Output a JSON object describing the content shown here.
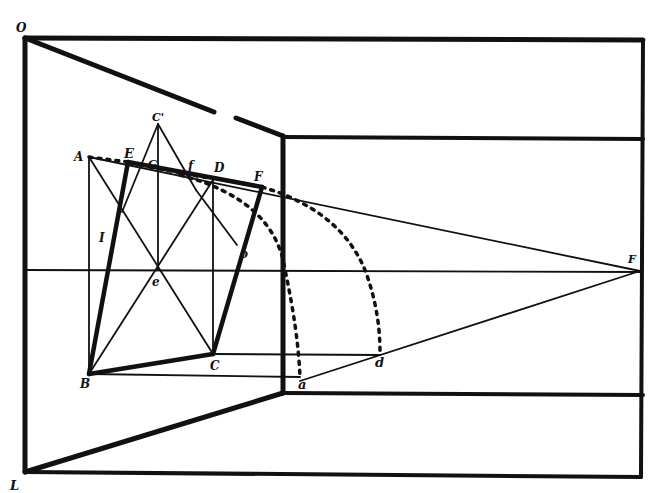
{
  "diagram": {
    "type": "perspective geometric construction",
    "ink_color": "#111111",
    "background": "#ffffff",
    "labels": {
      "O": "O",
      "L": "L",
      "A": "A",
      "E": "E",
      "C_prime": "C'",
      "G": "G",
      "f": "f",
      "D": "D",
      "F": "F",
      "I": "I",
      "e": "e",
      "o": "o",
      "B": "B",
      "C": "C",
      "a": "a",
      "d": "d",
      "P": "F"
    }
  }
}
